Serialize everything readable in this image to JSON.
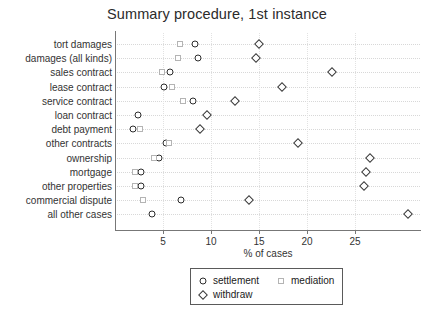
{
  "chart_data": {
    "type": "scatter",
    "title": "Summary procedure, 1st instance",
    "xlabel": "% of cases",
    "ylabel": "",
    "xlim": [
      0,
      31.8
    ],
    "xticks": [
      5,
      10,
      15,
      20,
      25
    ],
    "xticklabels": [
      "5",
      "10",
      "15",
      "20",
      "25"
    ],
    "grid": true,
    "legend_position": "bottom-center",
    "categories": [
      "tort damages",
      "damages (all kinds)",
      "sales contract",
      "lease contract",
      "service contract",
      "loan contract",
      "debt payment",
      "other contracts",
      "ownership",
      "mortgage",
      "other properties",
      "commercial dispute",
      "all other cases"
    ],
    "series": [
      {
        "name": "settlement",
        "marker": "circle",
        "values": [
          8.3,
          8.6,
          5.7,
          5.1,
          8.1,
          2.4,
          1.9,
          5.3,
          4.6,
          2.7,
          2.7,
          6.9,
          3.9
        ]
      },
      {
        "name": "mediation",
        "marker": "square",
        "values": [
          6.8,
          6.6,
          4.9,
          5.9,
          7.1,
          null,
          2.6,
          5.6,
          4.1,
          2.1,
          2.1,
          2.9,
          null
        ]
      },
      {
        "name": "withdraw",
        "marker": "diamond",
        "values": [
          15.0,
          14.7,
          22.6,
          17.4,
          12.5,
          9.6,
          8.9,
          19.1,
          26.6,
          26.1,
          25.9,
          14.0,
          30.5
        ]
      }
    ]
  },
  "legend": {
    "items": [
      {
        "label": "settlement",
        "marker": "circle"
      },
      {
        "label": "mediation",
        "marker": "square"
      },
      {
        "label": "withdraw",
        "marker": "diamond"
      }
    ]
  }
}
